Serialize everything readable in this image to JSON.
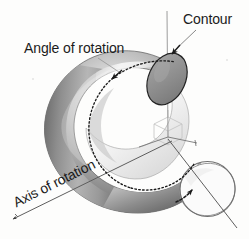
{
  "figure": {
    "type": "technical-diagram",
    "background_color": "#fdfdfc",
    "ink_color": "#1b1b1b"
  },
  "labels": {
    "contour": "Contour",
    "angle_of_rotation": "Angle of rotation",
    "axis_of_rotation": "Axis of rotation"
  },
  "elements": {
    "torus": {
      "name": "torus-surface",
      "shading": "grayscale-gradient",
      "highlight_color": "#f2f2f2",
      "shadow_color": "#4a4a4a",
      "mid_color": "#9a9a9a"
    },
    "contour_disk": {
      "name": "contour-cross-section-ellipse",
      "fill_color": "#8d8d8d",
      "stroke_color": "#2a2a2a"
    },
    "sweep_arc": {
      "name": "angle-of-rotation-dotted-arc",
      "style": "dotted",
      "color": "#1f1f1f",
      "has_arrowhead": true
    },
    "rotation_circle": {
      "name": "generating-circle-outline",
      "fill_color": "#ffffff",
      "stroke_color": "#6d6d6d",
      "has_curved_arrow": true
    },
    "axis_line": {
      "name": "axis-of-rotation-line",
      "color": "#555555",
      "has_arrowhead": true
    },
    "origin_cube": {
      "name": "origin-wireframe-cube",
      "color": "#b8b8b8"
    },
    "coordinate_axes": {
      "name": "coordinate-axes",
      "color": "#6a6a6a",
      "count": 3
    }
  }
}
